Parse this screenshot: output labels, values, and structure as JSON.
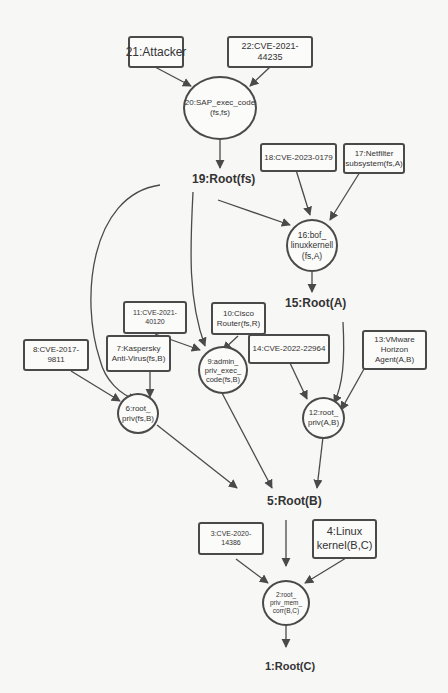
{
  "diagram": {
    "type": "attack-graph",
    "nodes": {
      "n21": {
        "id": 21,
        "label": "21:Attacker",
        "shape": "box"
      },
      "n22": {
        "id": 22,
        "label": "22:CVE-2021-44235",
        "shape": "box"
      },
      "n20": {
        "id": 20,
        "label": "20:SAP_exec_code\n(fs,fs)",
        "shape": "circle"
      },
      "n19": {
        "id": 19,
        "label": "19:Root(fs)",
        "shape": "plain"
      },
      "n18": {
        "id": 18,
        "label": "18:CVE-2023-0179",
        "shape": "box"
      },
      "n17": {
        "id": 17,
        "label": "17:Netfilter\nsubsystem(fs,A)",
        "shape": "box"
      },
      "n16": {
        "id": 16,
        "label": "16:bof_\nlinuxkernell\n(fs,A)",
        "shape": "circle"
      },
      "n15": {
        "id": 15,
        "label": "15:Root(A)",
        "shape": "plain"
      },
      "n14": {
        "id": 14,
        "label": "14:CVE-2022-22964",
        "shape": "box"
      },
      "n13": {
        "id": 13,
        "label": "13:VMware\nHorizon\nAgent(A,B)",
        "shape": "box"
      },
      "n12": {
        "id": 12,
        "label": "12:root_\npriv(A,B)",
        "shape": "circle"
      },
      "n11": {
        "id": 11,
        "label": "11:CVE-2021-40120",
        "shape": "box"
      },
      "n10": {
        "id": 10,
        "label": "10:Cisco\nRouter(fs,R)",
        "shape": "box"
      },
      "n9": {
        "id": 9,
        "label": "9:admin_\npriv_exec_\ncode(fs,B)",
        "shape": "circle"
      },
      "n8": {
        "id": 8,
        "label": "8:CVE-2017-9811",
        "shape": "box"
      },
      "n7": {
        "id": 7,
        "label": "7:Kaspersky\nAnti-Virus(fs,B)",
        "shape": "box"
      },
      "n6": {
        "id": 6,
        "label": "6:root_\npriv(fs,B)",
        "shape": "circle"
      },
      "n5": {
        "id": 5,
        "label": "5:Root(B)",
        "shape": "plain"
      },
      "n4": {
        "id": 4,
        "label": "4:Linux\nkernel(B,C)",
        "shape": "box"
      },
      "n3": {
        "id": 3,
        "label": "3:CVE-2020-14386",
        "shape": "box"
      },
      "n2": {
        "id": 2,
        "label": "2:root_\npriv_mem_\ncorr(B,C)",
        "shape": "circle"
      },
      "n1": {
        "id": 1,
        "label": "1:Root(C)",
        "shape": "plain"
      }
    },
    "edges": [
      {
        "from": 21,
        "to": 20
      },
      {
        "from": 22,
        "to": 20
      },
      {
        "from": 20,
        "to": 19
      },
      {
        "from": 19,
        "to": 16
      },
      {
        "from": 18,
        "to": 16
      },
      {
        "from": 17,
        "to": 16
      },
      {
        "from": 16,
        "to": 15
      },
      {
        "from": 19,
        "to": 9
      },
      {
        "from": 19,
        "to": 6
      },
      {
        "from": 11,
        "to": 9
      },
      {
        "from": 10,
        "to": 9
      },
      {
        "from": 8,
        "to": 6
      },
      {
        "from": 7,
        "to": 6
      },
      {
        "from": 15,
        "to": 12
      },
      {
        "from": 14,
        "to": 12
      },
      {
        "from": 13,
        "to": 12
      },
      {
        "from": 6,
        "to": 5
      },
      {
        "from": 9,
        "to": 5
      },
      {
        "from": 12,
        "to": 5
      },
      {
        "from": 5,
        "to": 2
      },
      {
        "from": 3,
        "to": 2
      },
      {
        "from": 4,
        "to": 2
      },
      {
        "from": 2,
        "to": 1
      }
    ],
    "colors": {
      "stroke": "#4a4a4a",
      "background": "#f7f7f5",
      "text": "#333333"
    }
  }
}
